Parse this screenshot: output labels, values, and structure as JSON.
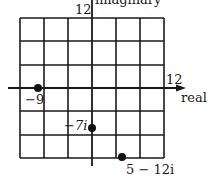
{
  "figure": {
    "type": "complex-plane",
    "axes": {
      "horizontal_label": "real",
      "vertical_label": "imaginary",
      "horizontal_max_label": "12",
      "vertical_max_label": "12"
    },
    "grid": {
      "cells_x": 6,
      "cells_y": 6,
      "units_per_cell": 4
    },
    "points": [
      {
        "label": "−9",
        "re": -9,
        "im": 0
      },
      {
        "label": "−7i",
        "re": 0,
        "im": -7
      },
      {
        "label": "5 − 12i",
        "re": 5,
        "im": -12
      }
    ],
    "colors": {
      "ink": "#1a1a1a",
      "background": "#ffffff"
    }
  }
}
